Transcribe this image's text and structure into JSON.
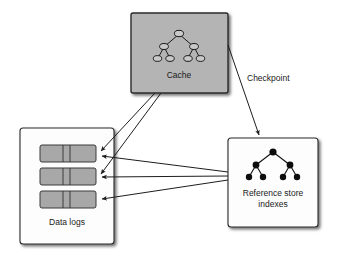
{
  "diagram": {
    "canvas": {
      "width": 343,
      "height": 262,
      "background": "#ffffff"
    },
    "palette": {
      "box_fill_white": "#fdfdfd",
      "box_fill_gray": "#b4b4b4",
      "bar_fill": "#a8a8a8",
      "stroke": "#2b2b2b",
      "shadow": "#a9a9a9",
      "text": "#1a1a1a",
      "node_hollow_fill": "#d2d2d2",
      "node_solid_fill": "#0d0d0d"
    },
    "nodes": [
      {
        "id": "cache",
        "label": "Cache",
        "shape": "rectangle",
        "fill": "#b4b4b4",
        "x": 131,
        "y": 13,
        "width": 97,
        "height": 80,
        "label_x": 179,
        "label_y": 76,
        "glyph": "binary-tree-hollow-nodes"
      },
      {
        "id": "data-logs",
        "label": "Data logs",
        "shape": "rectangle",
        "fill": "#fdfdfd",
        "x": 20,
        "y": 128,
        "width": 94,
        "height": 116,
        "label_x": 67,
        "label_y": 223,
        "glyph": "three-segmented-log-bars"
      },
      {
        "id": "reference-store-indexes",
        "label_line_1": "Reference store",
        "label_line_2": "indexes",
        "shape": "rectangle",
        "fill": "#fdfdfd",
        "x": 228,
        "y": 138,
        "width": 90,
        "height": 89,
        "label_x": 273,
        "label_y": 194,
        "glyph": "binary-tree-solid-nodes"
      }
    ],
    "log_bars": [
      {
        "id": "log-bar-1",
        "x": 40,
        "y": 145,
        "width": 56,
        "height": 17
      },
      {
        "id": "log-bar-2",
        "x": 40,
        "y": 168,
        "width": 56,
        "height": 17
      },
      {
        "id": "log-bar-3",
        "x": 40,
        "y": 191,
        "width": 56,
        "height": 17
      }
    ],
    "edges": [
      {
        "id": "edge-cache-checkpoint-to-reference",
        "from": "cache",
        "to": "reference-store-indexes",
        "label": "Checkpoint",
        "label_x": 247,
        "label_y": 79
      },
      {
        "id": "edge-cache-to-log-bar-1",
        "from": "cache",
        "to": "log-bar-1",
        "label": ""
      },
      {
        "id": "edge-cache-to-log-bar-2",
        "from": "cache",
        "to": "log-bar-2",
        "label": ""
      },
      {
        "id": "edge-reference-to-log-bar-1",
        "from": "reference-store-indexes",
        "to": "log-bar-1",
        "label": ""
      },
      {
        "id": "edge-reference-to-log-bar-2",
        "from": "reference-store-indexes",
        "to": "log-bar-2",
        "label": ""
      },
      {
        "id": "edge-reference-to-log-bar-3",
        "from": "reference-store-indexes",
        "to": "log-bar-3",
        "label": ""
      }
    ],
    "labels": {
      "cache": "Cache",
      "data_logs": "Data logs",
      "reference_store_line1": "Reference store",
      "reference_store_line2": "indexes",
      "checkpoint": "Checkpoint"
    }
  }
}
